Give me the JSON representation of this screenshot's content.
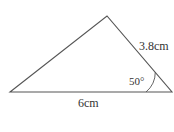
{
  "diagram": {
    "type": "triangle",
    "vertices": {
      "left": [
        10,
        92
      ],
      "apex": [
        107,
        16
      ],
      "right": [
        172,
        92
      ]
    },
    "colors": {
      "stroke": "#555555",
      "text": "#333333",
      "background": "#ffffff"
    },
    "labels": {
      "base": "6cm",
      "right_side": "3.8cm",
      "angle": "50°"
    }
  }
}
